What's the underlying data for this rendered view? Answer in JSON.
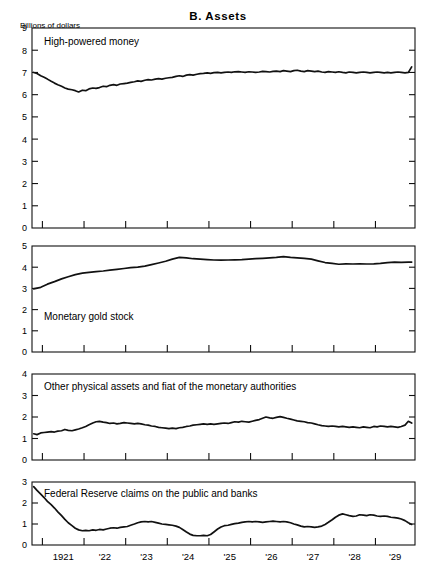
{
  "figure": {
    "title": "B.  Assets",
    "units_label": "Billions of dollars"
  },
  "chart_data": {
    "type": "line",
    "title": "B. Assets",
    "subtitle": "",
    "xlabel": "",
    "ylabel": "Billions of dollars",
    "grid": false,
    "legend_position": "inside-panel-labels",
    "x_axis": {
      "range": [
        1920.75,
        1929.95
      ],
      "tick_values": [
        1921,
        1922,
        1923,
        1924,
        1925,
        1926,
        1927,
        1928,
        1929
      ],
      "tick_labels": [
        "1921",
        "'22",
        "'23",
        "'24",
        "'25",
        "'26",
        "'27",
        "'28",
        "'29"
      ],
      "label_placement": "between-ticks"
    },
    "panels": [
      {
        "name": "high-powered-money",
        "label": "High-powered money",
        "ylim": [
          0,
          9
        ],
        "yticks": [
          0,
          1,
          2,
          3,
          4,
          5,
          6,
          7,
          8,
          9
        ],
        "ytick_labels": [
          "0",
          "1",
          "2",
          "3",
          "4",
          "5",
          "6",
          "7",
          "8",
          "9"
        ],
        "x": [
          1920.79,
          1920.87,
          1920.96,
          1921.04,
          1921.12,
          1921.21,
          1921.29,
          1921.37,
          1921.46,
          1921.54,
          1921.62,
          1921.71,
          1921.79,
          1921.87,
          1921.96,
          1922.04,
          1922.12,
          1922.21,
          1922.29,
          1922.37,
          1922.46,
          1922.54,
          1922.62,
          1922.71,
          1922.79,
          1922.87,
          1922.96,
          1923.04,
          1923.12,
          1923.21,
          1923.29,
          1923.37,
          1923.46,
          1923.54,
          1923.62,
          1923.71,
          1923.79,
          1923.87,
          1923.96,
          1924.04,
          1924.12,
          1924.21,
          1924.29,
          1924.37,
          1924.46,
          1924.54,
          1924.62,
          1924.71,
          1924.79,
          1924.87,
          1924.96,
          1925.04,
          1925.12,
          1925.21,
          1925.29,
          1925.37,
          1925.46,
          1925.54,
          1925.62,
          1925.71,
          1925.79,
          1925.87,
          1925.96,
          1926.04,
          1926.12,
          1926.21,
          1926.29,
          1926.37,
          1926.46,
          1926.54,
          1926.62,
          1926.71,
          1926.79,
          1926.87,
          1926.96,
          1927.04,
          1927.12,
          1927.21,
          1927.29,
          1927.37,
          1927.46,
          1927.54,
          1927.62,
          1927.71,
          1927.79,
          1927.87,
          1927.96,
          1928.04,
          1928.12,
          1928.21,
          1928.29,
          1928.37,
          1928.46,
          1928.54,
          1928.62,
          1928.71,
          1928.79,
          1928.87,
          1928.96,
          1929.04,
          1929.12,
          1929.21,
          1929.29,
          1929.37,
          1929.46,
          1929.54,
          1929.62,
          1929.71,
          1929.79,
          1929.87
        ],
        "y": [
          7.0,
          6.95,
          6.85,
          6.78,
          6.7,
          6.6,
          6.52,
          6.45,
          6.38,
          6.3,
          6.25,
          6.22,
          6.18,
          6.12,
          6.2,
          6.18,
          6.26,
          6.3,
          6.28,
          6.32,
          6.38,
          6.36,
          6.42,
          6.45,
          6.42,
          6.48,
          6.5,
          6.52,
          6.55,
          6.58,
          6.62,
          6.6,
          6.65,
          6.68,
          6.66,
          6.7,
          6.72,
          6.7,
          6.74,
          6.76,
          6.78,
          6.82,
          6.85,
          6.82,
          6.88,
          6.9,
          6.88,
          6.92,
          6.95,
          6.96,
          6.98,
          6.96,
          6.99,
          7.0,
          6.98,
          7.0,
          7.02,
          7.0,
          7.03,
          7.04,
          7.02,
          7.0,
          7.03,
          7.02,
          7.0,
          7.02,
          7.05,
          7.04,
          7.02,
          7.05,
          7.06,
          7.04,
          7.08,
          7.06,
          7.04,
          7.08,
          7.1,
          7.06,
          7.04,
          7.08,
          7.06,
          7.04,
          7.06,
          7.02,
          7.0,
          7.04,
          7.02,
          7.0,
          7.03,
          7.0,
          6.98,
          7.02,
          7.0,
          6.98,
          7.0,
          7.02,
          7.0,
          6.98,
          7.0,
          7.02,
          7.0,
          6.98,
          7.0,
          6.98,
          7.0,
          7.02,
          7.0,
          6.98,
          7.0,
          7.25,
          6.95,
          7.0
        ]
      },
      {
        "name": "monetary-gold-stock",
        "label": "Monetary gold stock",
        "ylim": [
          0,
          5
        ],
        "yticks": [
          0,
          1,
          2,
          3,
          4,
          5
        ],
        "ytick_labels": [
          "0",
          "1",
          "2",
          "3",
          "4",
          "5"
        ],
        "x": [
          1920.79,
          1920.96,
          1921.12,
          1921.29,
          1921.46,
          1921.62,
          1921.79,
          1921.96,
          1922.12,
          1922.29,
          1922.46,
          1922.62,
          1922.79,
          1922.96,
          1923.12,
          1923.29,
          1923.46,
          1923.62,
          1923.79,
          1923.96,
          1924.12,
          1924.29,
          1924.46,
          1924.62,
          1924.79,
          1924.96,
          1925.12,
          1925.29,
          1925.46,
          1925.62,
          1925.79,
          1925.96,
          1926.12,
          1926.29,
          1926.46,
          1926.62,
          1926.79,
          1926.96,
          1927.12,
          1927.29,
          1927.46,
          1927.62,
          1927.79,
          1927.96,
          1928.12,
          1928.29,
          1928.46,
          1928.62,
          1928.79,
          1928.96,
          1929.12,
          1929.29,
          1929.46,
          1929.62,
          1929.79,
          1929.87
        ],
        "y": [
          2.98,
          3.05,
          3.2,
          3.32,
          3.45,
          3.55,
          3.65,
          3.72,
          3.76,
          3.79,
          3.82,
          3.86,
          3.9,
          3.94,
          3.98,
          4.0,
          4.05,
          4.12,
          4.2,
          4.28,
          4.38,
          4.46,
          4.44,
          4.4,
          4.38,
          4.36,
          4.34,
          4.33,
          4.34,
          4.35,
          4.36,
          4.38,
          4.4,
          4.42,
          4.44,
          4.46,
          4.5,
          4.46,
          4.44,
          4.42,
          4.38,
          4.3,
          4.22,
          4.18,
          4.14,
          4.16,
          4.15,
          4.16,
          4.15,
          4.16,
          4.18,
          4.22,
          4.24,
          4.23,
          4.24,
          4.24
        ]
      },
      {
        "name": "other-physical-assets-and-fiat",
        "label": "Other physical assets and fiat of the monetary authorities",
        "ylim": [
          0,
          4
        ],
        "yticks": [
          0,
          1,
          2,
          3,
          4
        ],
        "ytick_labels": [
          "0",
          "1",
          "2",
          "3",
          "4"
        ],
        "x": [
          1920.79,
          1920.87,
          1920.96,
          1921.04,
          1921.12,
          1921.21,
          1921.29,
          1921.37,
          1921.46,
          1921.54,
          1921.62,
          1921.71,
          1921.79,
          1921.87,
          1921.96,
          1922.04,
          1922.12,
          1922.21,
          1922.29,
          1922.37,
          1922.46,
          1922.54,
          1922.62,
          1922.71,
          1922.79,
          1922.87,
          1922.96,
          1923.04,
          1923.12,
          1923.21,
          1923.29,
          1923.37,
          1923.46,
          1923.54,
          1923.62,
          1923.71,
          1923.79,
          1923.87,
          1923.96,
          1924.04,
          1924.12,
          1924.21,
          1924.29,
          1924.37,
          1924.46,
          1924.54,
          1924.62,
          1924.71,
          1924.79,
          1924.87,
          1924.96,
          1925.04,
          1925.12,
          1925.21,
          1925.29,
          1925.37,
          1925.46,
          1925.54,
          1925.62,
          1925.71,
          1925.79,
          1925.87,
          1925.96,
          1926.04,
          1926.12,
          1926.21,
          1926.29,
          1926.37,
          1926.46,
          1926.54,
          1926.62,
          1926.71,
          1926.79,
          1926.87,
          1926.96,
          1927.04,
          1927.12,
          1927.21,
          1927.29,
          1927.37,
          1927.46,
          1927.54,
          1927.62,
          1927.71,
          1927.79,
          1927.87,
          1927.96,
          1928.04,
          1928.12,
          1928.21,
          1928.29,
          1928.37,
          1928.46,
          1928.54,
          1928.62,
          1928.71,
          1928.79,
          1928.87,
          1928.96,
          1929.04,
          1929.12,
          1929.21,
          1929.29,
          1929.37,
          1929.46,
          1929.54,
          1929.62,
          1929.71,
          1929.79,
          1929.87
        ],
        "y": [
          1.22,
          1.18,
          1.26,
          1.28,
          1.3,
          1.32,
          1.3,
          1.34,
          1.36,
          1.42,
          1.38,
          1.36,
          1.4,
          1.44,
          1.5,
          1.56,
          1.64,
          1.72,
          1.78,
          1.8,
          1.76,
          1.74,
          1.7,
          1.72,
          1.68,
          1.7,
          1.74,
          1.72,
          1.7,
          1.68,
          1.7,
          1.68,
          1.64,
          1.62,
          1.58,
          1.56,
          1.52,
          1.5,
          1.48,
          1.46,
          1.48,
          1.46,
          1.5,
          1.52,
          1.56,
          1.58,
          1.62,
          1.64,
          1.66,
          1.68,
          1.66,
          1.68,
          1.66,
          1.68,
          1.7,
          1.72,
          1.7,
          1.74,
          1.78,
          1.76,
          1.8,
          1.78,
          1.76,
          1.8,
          1.84,
          1.88,
          1.94,
          2.0,
          1.96,
          1.94,
          1.98,
          2.02,
          1.98,
          1.94,
          1.9,
          1.86,
          1.82,
          1.8,
          1.78,
          1.74,
          1.72,
          1.68,
          1.64,
          1.6,
          1.58,
          1.56,
          1.58,
          1.56,
          1.54,
          1.56,
          1.54,
          1.52,
          1.54,
          1.52,
          1.5,
          1.54,
          1.52,
          1.5,
          1.56,
          1.54,
          1.58,
          1.56,
          1.54,
          1.56,
          1.54,
          1.52,
          1.56,
          1.62,
          1.8,
          1.72
        ]
      },
      {
        "name": "federal-reserve-claims",
        "label": "Federal Reserve claims on the public and banks",
        "ylim": [
          0,
          3
        ],
        "yticks": [
          0,
          1,
          2,
          3
        ],
        "ytick_labels": [
          "0",
          "1",
          "2",
          "3"
        ],
        "x": [
          1920.79,
          1920.87,
          1920.96,
          1921.04,
          1921.12,
          1921.21,
          1921.29,
          1921.37,
          1921.46,
          1921.54,
          1921.62,
          1921.71,
          1921.79,
          1921.87,
          1921.96,
          1922.04,
          1922.12,
          1922.21,
          1922.29,
          1922.37,
          1922.46,
          1922.54,
          1922.62,
          1922.71,
          1922.79,
          1922.87,
          1922.96,
          1923.04,
          1923.12,
          1923.21,
          1923.29,
          1923.37,
          1923.46,
          1923.54,
          1923.62,
          1923.71,
          1923.79,
          1923.87,
          1923.96,
          1924.04,
          1924.12,
          1924.21,
          1924.29,
          1924.37,
          1924.46,
          1924.54,
          1924.62,
          1924.71,
          1924.79,
          1924.87,
          1924.96,
          1925.04,
          1925.12,
          1925.21,
          1925.29,
          1925.37,
          1925.46,
          1925.54,
          1925.62,
          1925.71,
          1925.79,
          1925.87,
          1925.96,
          1926.04,
          1926.12,
          1926.21,
          1926.29,
          1926.37,
          1926.46,
          1926.54,
          1926.62,
          1926.71,
          1926.79,
          1926.87,
          1926.96,
          1927.04,
          1927.12,
          1927.21,
          1927.29,
          1927.37,
          1927.46,
          1927.54,
          1927.62,
          1927.71,
          1927.79,
          1927.87,
          1927.96,
          1928.04,
          1928.12,
          1928.21,
          1928.29,
          1928.37,
          1928.46,
          1928.54,
          1928.62,
          1928.71,
          1928.79,
          1928.87,
          1928.96,
          1929.04,
          1929.12,
          1929.21,
          1929.29,
          1929.37,
          1929.46,
          1929.54,
          1929.62,
          1929.71,
          1929.79,
          1929.87
        ],
        "y": [
          2.78,
          2.6,
          2.42,
          2.26,
          2.08,
          1.92,
          1.76,
          1.58,
          1.4,
          1.22,
          1.06,
          0.92,
          0.8,
          0.72,
          0.68,
          0.7,
          0.68,
          0.72,
          0.7,
          0.74,
          0.72,
          0.76,
          0.8,
          0.82,
          0.8,
          0.84,
          0.86,
          0.88,
          0.94,
          1.0,
          1.06,
          1.1,
          1.12,
          1.1,
          1.12,
          1.08,
          1.04,
          1.0,
          0.98,
          0.96,
          0.94,
          0.9,
          0.84,
          0.74,
          0.62,
          0.52,
          0.46,
          0.44,
          0.44,
          0.46,
          0.44,
          0.5,
          0.62,
          0.76,
          0.86,
          0.92,
          0.94,
          0.98,
          1.02,
          1.04,
          1.08,
          1.1,
          1.12,
          1.1,
          1.12,
          1.1,
          1.08,
          1.1,
          1.12,
          1.14,
          1.12,
          1.1,
          1.12,
          1.1,
          1.06,
          1.0,
          0.96,
          0.9,
          0.86,
          0.88,
          0.86,
          0.84,
          0.86,
          0.9,
          0.98,
          1.08,
          1.2,
          1.32,
          1.42,
          1.48,
          1.44,
          1.4,
          1.36,
          1.38,
          1.44,
          1.42,
          1.4,
          1.44,
          1.42,
          1.38,
          1.36,
          1.38,
          1.36,
          1.32,
          1.3,
          1.28,
          1.24,
          1.16,
          1.06,
          0.98
        ]
      }
    ]
  }
}
